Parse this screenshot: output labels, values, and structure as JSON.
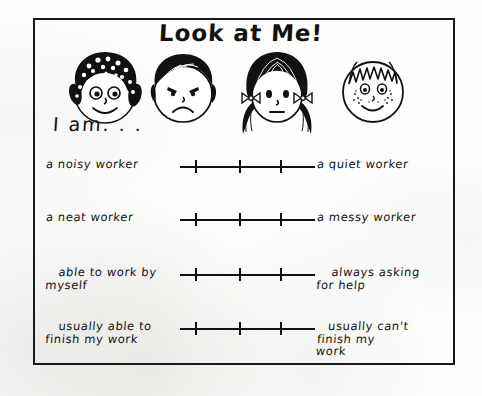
{
  "worksheet": {
    "title": "Look at Me!",
    "prompt": "I am. . .",
    "faces": [
      {
        "name": "curly-hair-smiling-face",
        "expression": "smiling",
        "hair": "curly dark afro"
      },
      {
        "name": "short-hair-frowning-face",
        "expression": "frowning",
        "hair": "short dark bowl cut"
      },
      {
        "name": "pigtails-neutral-face",
        "expression": "neutral",
        "hair": "long hair with pigtails and bows"
      },
      {
        "name": "freckled-smiling-face",
        "expression": "smiling with freckles",
        "hair": "short spiky light hair"
      }
    ],
    "scales": [
      {
        "left_label": "a noisy worker",
        "right_label": "a quiet worker",
        "ticks": 3
      },
      {
        "left_label": "a neat worker",
        "right_label": "a messy worker",
        "ticks": 3
      },
      {
        "left_label": "able to work by\nmyself",
        "right_label": "always asking\nfor help",
        "ticks": 3
      },
      {
        "left_label": "usually able to\nfinish my work",
        "right_label": "usually can't\nfinish my\nwork",
        "ticks": 3
      }
    ]
  },
  "colors": {
    "ink": "#111111",
    "paper": "#fdfdfc"
  }
}
